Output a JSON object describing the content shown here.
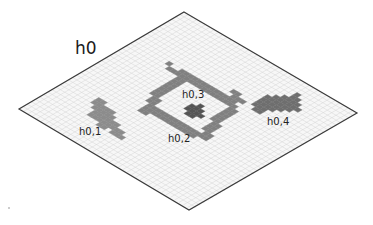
{
  "diagram": {
    "title": "h0",
    "grid": {
      "cells": 40,
      "vertices": {
        "top": [
          184,
          12
        ],
        "right": [
          357,
          113
        ],
        "bottom": [
          189,
          210
        ],
        "left": [
          19,
          109
        ]
      },
      "fill_color": "#f7f7f7",
      "grid_line_color": "#d4d4d4",
      "border_color": "#3a3a3a"
    },
    "labels": [
      {
        "id": "h0",
        "text": "h0",
        "x": 75,
        "y": 40,
        "size": "main"
      },
      {
        "id": "h0_1",
        "text": "h0,1",
        "x": 79,
        "y": 127,
        "size": "small"
      },
      {
        "id": "h0_2",
        "text": "h0,2",
        "x": 168,
        "y": 134,
        "size": "small"
      },
      {
        "id": "h0_3",
        "text": "h0,3",
        "x": 182,
        "y": 90,
        "size": "small"
      },
      {
        "id": "h0_4",
        "text": "h0,4",
        "x": 267,
        "y": 117,
        "size": "small"
      }
    ],
    "regions": [
      {
        "id": "h0,1",
        "color": "#8c8c8c",
        "cells": [
          [
            7,
            28
          ],
          [
            8,
            28
          ],
          [
            7,
            29
          ],
          [
            8,
            29
          ],
          [
            9,
            29
          ],
          [
            8,
            30
          ],
          [
            9,
            30
          ],
          [
            10,
            30
          ],
          [
            9,
            31
          ],
          [
            10,
            31
          ],
          [
            11,
            31
          ],
          [
            9,
            32
          ],
          [
            10,
            32
          ],
          [
            11,
            32
          ],
          [
            12,
            32
          ],
          [
            11,
            30
          ],
          [
            12,
            31
          ],
          [
            13,
            31
          ],
          [
            13,
            32
          ],
          [
            14,
            32
          ],
          [
            12,
            33
          ],
          [
            13,
            33
          ],
          [
            14,
            31
          ],
          [
            15,
            32
          ],
          [
            15,
            33
          ],
          [
            16,
            33
          ],
          [
            16,
            32
          ],
          [
            17,
            33
          ],
          [
            10,
            29
          ],
          [
            11,
            29
          ],
          [
            12,
            30
          ]
        ]
      },
      {
        "id": "h0,2",
        "color": "#808080",
        "cells": [
          [
            11,
            12
          ],
          [
            12,
            12
          ],
          [
            11,
            13
          ],
          [
            12,
            13
          ],
          [
            13,
            13
          ],
          [
            13,
            12
          ],
          [
            14,
            12
          ],
          [
            15,
            12
          ],
          [
            16,
            12
          ],
          [
            17,
            12
          ],
          [
            18,
            12
          ],
          [
            19,
            12
          ],
          [
            20,
            12
          ],
          [
            21,
            12
          ],
          [
            22,
            12
          ],
          [
            22,
            13
          ],
          [
            23,
            12
          ],
          [
            23,
            13
          ],
          [
            12,
            14
          ],
          [
            13,
            14
          ],
          [
            12,
            15
          ],
          [
            13,
            15
          ],
          [
            12,
            16
          ],
          [
            13,
            16
          ],
          [
            12,
            17
          ],
          [
            13,
            17
          ],
          [
            12,
            18
          ],
          [
            13,
            18
          ],
          [
            12,
            19
          ],
          [
            13,
            19
          ],
          [
            12,
            20
          ],
          [
            13,
            20
          ],
          [
            13,
            21
          ],
          [
            14,
            21
          ],
          [
            13,
            22
          ],
          [
            14,
            22
          ],
          [
            14,
            23
          ],
          [
            15,
            23
          ],
          [
            14,
            24
          ],
          [
            15,
            24
          ],
          [
            14,
            25
          ],
          [
            15,
            25
          ],
          [
            14,
            13
          ],
          [
            15,
            13
          ],
          [
            16,
            13
          ],
          [
            17,
            13
          ],
          [
            18,
            13
          ],
          [
            19,
            13
          ],
          [
            20,
            13
          ],
          [
            21,
            13
          ],
          [
            24,
            13
          ],
          [
            24,
            14
          ],
          [
            25,
            14
          ],
          [
            24,
            15
          ],
          [
            25,
            15
          ],
          [
            24,
            16
          ],
          [
            25,
            16
          ],
          [
            24,
            17
          ],
          [
            25,
            17
          ],
          [
            24,
            18
          ],
          [
            25,
            18
          ],
          [
            25,
            19
          ],
          [
            26,
            19
          ],
          [
            25,
            20
          ],
          [
            26,
            20
          ],
          [
            25,
            21
          ],
          [
            26,
            21
          ],
          [
            26,
            22
          ],
          [
            27,
            22
          ],
          [
            26,
            23
          ],
          [
            27,
            23
          ],
          [
            16,
            24
          ],
          [
            17,
            24
          ],
          [
            18,
            24
          ],
          [
            19,
            24
          ],
          [
            20,
            24
          ],
          [
            21,
            24
          ],
          [
            22,
            24
          ],
          [
            23,
            24
          ],
          [
            24,
            24
          ],
          [
            25,
            24
          ],
          [
            16,
            23
          ],
          [
            17,
            23
          ],
          [
            18,
            23
          ],
          [
            19,
            23
          ],
          [
            20,
            23
          ],
          [
            21,
            23
          ],
          [
            22,
            23
          ],
          [
            23,
            23
          ],
          [
            24,
            23
          ],
          [
            25,
            23
          ],
          [
            9,
            13
          ],
          [
            10,
            13
          ],
          [
            8,
            12
          ],
          [
            21,
            10
          ],
          [
            22,
            10
          ],
          [
            22,
            11
          ],
          [
            23,
            11
          ],
          [
            24,
            11
          ]
        ]
      },
      {
        "id": "h0,3",
        "color": "#555555",
        "cells": [
          [
            19,
            18
          ],
          [
            20,
            18
          ],
          [
            21,
            18
          ],
          [
            19,
            19
          ],
          [
            20,
            19
          ],
          [
            21,
            19
          ],
          [
            22,
            19
          ],
          [
            20,
            20
          ],
          [
            21,
            20
          ],
          [
            20,
            17
          ]
        ]
      },
      {
        "id": "h0,4",
        "color": "#6e6e6e",
        "cells": [
          [
            29,
            3
          ],
          [
            29,
            4
          ],
          [
            30,
            4
          ],
          [
            28,
            5
          ],
          [
            29,
            5
          ],
          [
            30,
            5
          ],
          [
            31,
            5
          ],
          [
            27,
            6
          ],
          [
            28,
            6
          ],
          [
            29,
            6
          ],
          [
            30,
            6
          ],
          [
            31,
            6
          ],
          [
            32,
            6
          ],
          [
            26,
            7
          ],
          [
            27,
            7
          ],
          [
            28,
            7
          ],
          [
            29,
            7
          ],
          [
            30,
            7
          ],
          [
            31,
            7
          ],
          [
            26,
            8
          ],
          [
            27,
            8
          ],
          [
            28,
            8
          ],
          [
            29,
            8
          ],
          [
            30,
            8
          ],
          [
            26,
            9
          ],
          [
            27,
            9
          ],
          [
            28,
            9
          ],
          [
            29,
            9
          ],
          [
            26,
            10
          ],
          [
            27,
            10
          ],
          [
            28,
            10
          ],
          [
            27,
            11
          ],
          [
            28,
            11
          ]
        ]
      }
    ],
    "artifacts": [
      [
        9,
        208
      ]
    ]
  }
}
